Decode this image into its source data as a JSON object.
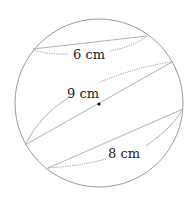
{
  "diagram": {
    "type": "sphere-cross-sections",
    "circle": {
      "cx": 99,
      "cy": 103,
      "r": 84,
      "stroke": "#9a9a9a"
    },
    "center_dot": {
      "cx": 99,
      "cy": 104
    },
    "sections": [
      {
        "label": "6 cm",
        "value": 6,
        "unit": "cm",
        "position": "top"
      },
      {
        "label": "9 cm",
        "value": 9,
        "unit": "cm",
        "position": "middle (through center)"
      },
      {
        "label": "8 cm",
        "value": 8,
        "unit": "cm",
        "position": "bottom"
      }
    ]
  }
}
